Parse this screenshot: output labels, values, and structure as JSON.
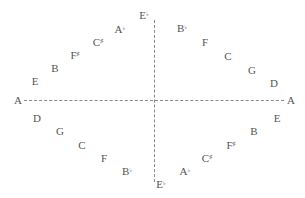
{
  "diagram": {
    "type": "circle-of-fifths-rhombus",
    "axes": {
      "horizontal": {
        "left_label": "A",
        "right_label": "A"
      },
      "vertical": {
        "top_label": "E♭",
        "bottom_label": "E♭"
      }
    },
    "labels": [
      {
        "id": "a-left",
        "note": "A",
        "acc": "",
        "x": 18,
        "y": 100
      },
      {
        "id": "e-tl",
        "note": "E",
        "acc": "",
        "x": 35,
        "y": 81
      },
      {
        "id": "b-tl",
        "note": "B",
        "acc": "",
        "x": 55,
        "y": 68
      },
      {
        "id": "fs-tl",
        "note": "F",
        "acc": "♯",
        "x": 75,
        "y": 55
      },
      {
        "id": "cs-tl",
        "note": "C",
        "acc": "♯",
        "x": 98,
        "y": 42
      },
      {
        "id": "ab-tl",
        "note": "A",
        "acc": "♭",
        "x": 120,
        "y": 29
      },
      {
        "id": "eb-top",
        "note": "E",
        "acc": "♭",
        "x": 144,
        "y": 15
      },
      {
        "id": "bb-tr",
        "note": "B",
        "acc": "♭",
        "x": 182,
        "y": 28
      },
      {
        "id": "f-tr",
        "note": "F",
        "acc": "",
        "x": 205,
        "y": 42
      },
      {
        "id": "c-tr",
        "note": "C",
        "acc": "",
        "x": 228,
        "y": 56
      },
      {
        "id": "g-tr",
        "note": "G",
        "acc": "",
        "x": 252,
        "y": 70
      },
      {
        "id": "d-tr",
        "note": "D",
        "acc": "",
        "x": 274,
        "y": 83
      },
      {
        "id": "a-right",
        "note": "A",
        "acc": "",
        "x": 291,
        "y": 100
      },
      {
        "id": "d-bl",
        "note": "D",
        "acc": "",
        "x": 37,
        "y": 118
      },
      {
        "id": "g-bl",
        "note": "G",
        "acc": "",
        "x": 60,
        "y": 131
      },
      {
        "id": "c-bl",
        "note": "C",
        "acc": "",
        "x": 82,
        "y": 145
      },
      {
        "id": "f-bl",
        "note": "F",
        "acc": "",
        "x": 104,
        "y": 158
      },
      {
        "id": "bb-bl",
        "note": "B",
        "acc": "♭",
        "x": 127,
        "y": 171
      },
      {
        "id": "eb-bottom",
        "note": "E",
        "acc": "♭",
        "x": 161,
        "y": 184
      },
      {
        "id": "ab-br",
        "note": "A",
        "acc": "♭",
        "x": 185,
        "y": 171
      },
      {
        "id": "cs-br",
        "note": "C",
        "acc": "♯",
        "x": 207,
        "y": 158
      },
      {
        "id": "fs-br",
        "note": "F",
        "acc": "♯",
        "x": 231,
        "y": 145
      },
      {
        "id": "b-br",
        "note": "B",
        "acc": "",
        "x": 254,
        "y": 131
      },
      {
        "id": "e-br",
        "note": "E",
        "acc": "",
        "x": 277,
        "y": 118
      }
    ]
  }
}
